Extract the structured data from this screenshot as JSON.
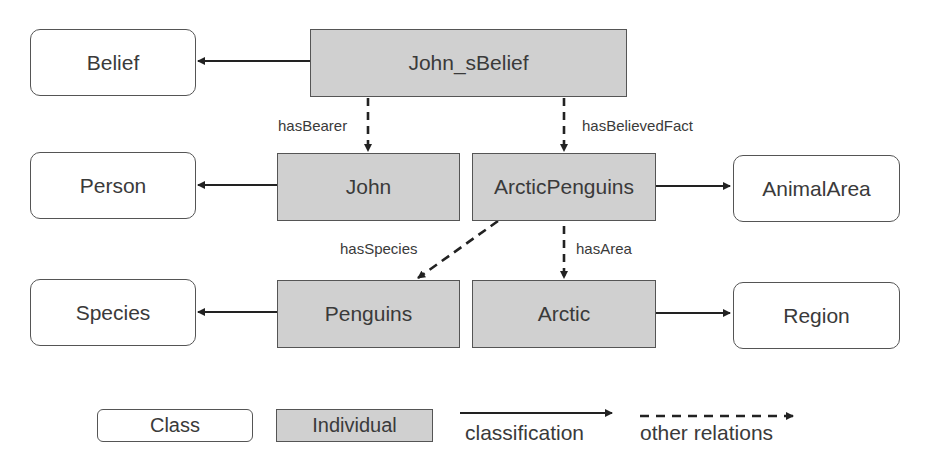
{
  "diagram": {
    "nodes": {
      "belief": {
        "label": "Belief",
        "kind": "class"
      },
      "john_sbelief": {
        "label": "John_sBelief",
        "kind": "individual"
      },
      "person": {
        "label": "Person",
        "kind": "class"
      },
      "john": {
        "label": "John",
        "kind": "individual"
      },
      "arcticpenguins": {
        "label": "ArcticPenguins",
        "kind": "individual"
      },
      "animalarea": {
        "label": "AnimalArea",
        "kind": "class"
      },
      "species": {
        "label": "Species",
        "kind": "class"
      },
      "penguins": {
        "label": "Penguins",
        "kind": "individual"
      },
      "arctic": {
        "label": "Arctic",
        "kind": "individual"
      },
      "region": {
        "label": "Region",
        "kind": "class"
      }
    },
    "edges": [
      {
        "from": "John_sBelief",
        "to": "Belief",
        "type": "classification"
      },
      {
        "from": "John",
        "to": "Person",
        "type": "classification"
      },
      {
        "from": "ArcticPenguins",
        "to": "AnimalArea",
        "type": "classification"
      },
      {
        "from": "Penguins",
        "to": "Species",
        "type": "classification"
      },
      {
        "from": "Arctic",
        "to": "Region",
        "type": "classification"
      },
      {
        "from": "John_sBelief",
        "to": "John",
        "type": "other",
        "label": "hasBearer"
      },
      {
        "from": "John_sBelief",
        "to": "ArcticPenguins",
        "type": "other",
        "label": "hasBelievedFact"
      },
      {
        "from": "ArcticPenguins",
        "to": "Penguins",
        "type": "other",
        "label": "hasSpecies"
      },
      {
        "from": "ArcticPenguins",
        "to": "Arctic",
        "type": "other",
        "label": "hasArea"
      }
    ],
    "edge_labels": {
      "hasBearer": "hasBearer",
      "hasBelievedFact": "hasBelievedFact",
      "hasSpecies": "hasSpecies",
      "hasArea": "hasArea"
    }
  },
  "legend": {
    "class": "Class",
    "individual": "Individual",
    "classification": "classification",
    "other_relations": "other relations"
  },
  "colors": {
    "individual_fill": "#d0d0d0",
    "class_fill": "#ffffff",
    "stroke": "#333333"
  }
}
